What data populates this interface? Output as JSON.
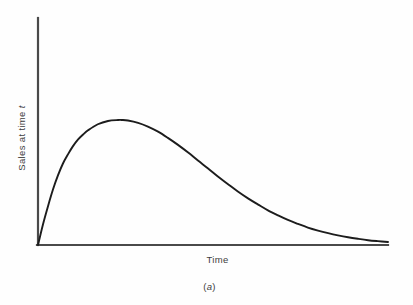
{
  "figure": {
    "caption_prefix": "(",
    "caption_letter": "a",
    "caption_suffix": ")",
    "caption": "(a)",
    "background_color": "#fefefe",
    "axis_color": "#4a4a4a",
    "curve_color": "#1c1c1c",
    "text_color": "#3d3d3d"
  },
  "chart_data": {
    "type": "line",
    "title": "",
    "subtitle": "",
    "xlabel": "Time",
    "ylabel": "Sales at time t",
    "ylabel_text": "Sales at time ",
    "ylabel_variable": "t",
    "legend": [],
    "legend_position": "none",
    "grid": false,
    "axis_ticks": false,
    "tick_labels_x": [],
    "tick_labels_y": [],
    "xlim": [
      0,
      1
    ],
    "ylim": [
      0,
      1
    ],
    "series": [
      {
        "name": "Sales at time t",
        "color": "#1c1c1c",
        "x": [
          0.0,
          0.014,
          0.029,
          0.043,
          0.057,
          0.071,
          0.086,
          0.1,
          0.114,
          0.129,
          0.143,
          0.171,
          0.2,
          0.229,
          0.24,
          0.257,
          0.286,
          0.314,
          0.343,
          0.371,
          0.4,
          0.429,
          0.457,
          0.486,
          0.514,
          0.543,
          0.571,
          0.6,
          0.629,
          0.657,
          0.686,
          0.714,
          0.743,
          0.771,
          0.8,
          0.829,
          0.857,
          0.886,
          0.914,
          0.943,
          0.971,
          1.0
        ],
        "y": [
          0.0,
          0.148,
          0.286,
          0.405,
          0.506,
          0.591,
          0.661,
          0.719,
          0.766,
          0.804,
          0.834,
          0.878,
          0.902,
          0.909,
          0.909,
          0.905,
          0.888,
          0.861,
          0.824,
          0.779,
          0.728,
          0.672,
          0.614,
          0.556,
          0.498,
          0.442,
          0.389,
          0.339,
          0.294,
          0.252,
          0.215,
          0.182,
          0.153,
          0.127,
          0.105,
          0.086,
          0.07,
          0.056,
          0.045,
          0.035,
          0.028,
          0.022
        ]
      }
    ]
  },
  "geometry": {
    "origin_x": 38,
    "origin_y": 245,
    "y_axis_top": 18,
    "x_axis_right": 388,
    "peak_x": 122,
    "peak_y": 120,
    "tail_merge_x": 330
  }
}
